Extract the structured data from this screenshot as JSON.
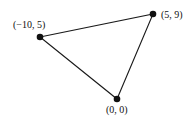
{
  "diagram": {
    "type": "triangle",
    "vertices": [
      {
        "label": "(−10, 5)",
        "x": 40,
        "y": 37,
        "lx": 13,
        "ly": 28
      },
      {
        "label": "(5, 9)",
        "x": 153,
        "y": 14,
        "lx": 161,
        "ly": 18
      },
      {
        "label": "(0, 0)",
        "x": 117,
        "y": 99,
        "lx": 106,
        "ly": 113
      }
    ],
    "colors": {
      "line": "#1a1a1a",
      "point": "#111111"
    }
  }
}
